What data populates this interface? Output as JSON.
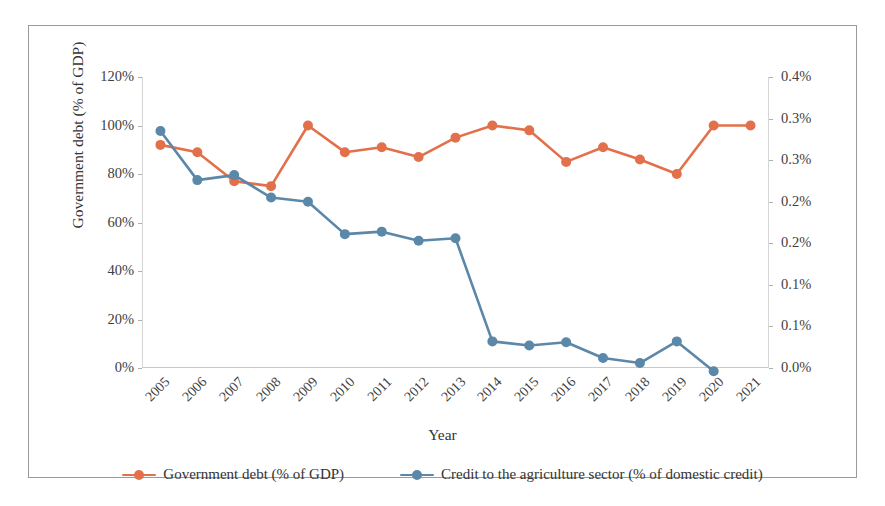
{
  "chart_data": {
    "type": "line",
    "title": "",
    "xlabel": "Year",
    "grid": false,
    "legend_position": "bottom",
    "categories": [
      "2005",
      "2006",
      "2007",
      "2008",
      "2009",
      "2010",
      "2011",
      "2012",
      "2013",
      "2014",
      "2015",
      "2016",
      "2017",
      "2018",
      "2019",
      "2020",
      "2021"
    ],
    "axes": {
      "left": {
        "label": "Government debt (% of GDP)",
        "ticks": [
          "0%",
          "20%",
          "40%",
          "60%",
          "80%",
          "100%",
          "120%"
        ],
        "tick_values": [
          0,
          20,
          40,
          60,
          80,
          100,
          120
        ],
        "ylim": [
          0,
          120
        ]
      },
      "right": {
        "label": "Credit to the agriculture sector (% of domestic credit)",
        "ticks": [
          "0.0%",
          "0.1%",
          "0.1%",
          "0.2%",
          "0.2%",
          "0.3%",
          "0.3%",
          "0.4%"
        ],
        "tick_values": [
          0.0,
          0.05,
          0.1,
          0.15,
          0.2,
          0.25,
          0.3,
          0.35
        ],
        "ylim": [
          0,
          0.35
        ]
      }
    },
    "series": [
      {
        "name": "Government debt (% of GDP)",
        "axis": "left",
        "color": "#E2714B",
        "values": [
          92,
          89,
          77,
          75,
          100,
          89,
          91,
          87,
          95,
          100,
          98,
          85,
          91,
          86,
          80,
          100,
          100
        ]
      },
      {
        "name": "Credit to the agriculture sector (% of domestic credit)",
        "axis": "right",
        "color": "#5B87A8",
        "values": [
          0.285,
          0.226,
          0.232,
          0.205,
          0.2,
          0.161,
          0.164,
          0.153,
          0.156,
          0.032,
          0.027,
          0.031,
          0.012,
          0.006,
          0.032,
          -0.004,
          null
        ]
      }
    ]
  },
  "legend": {
    "items": [
      {
        "label": "Government debt (% of GDP)",
        "color": "#E2714B"
      },
      {
        "label": "Credit to the agriculture sector (% of domestic credit)",
        "color": "#5B87A8"
      }
    ]
  },
  "colors": {
    "series_orange": "#E2714B",
    "series_blue": "#5B87A8",
    "frame": "#9a9a9a",
    "text": "#3a3a3a"
  }
}
